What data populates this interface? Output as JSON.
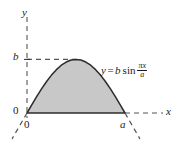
{
  "figure": {
    "colors": {
      "fill": "#c8c8c8",
      "stroke": "#2b2b2b",
      "dash": "#555555",
      "background": "#ffffff",
      "text": "#1a1a1a"
    },
    "axes": {
      "y_label": "y",
      "x_label": "x",
      "origin_y_label": "0",
      "origin_x_label": "0",
      "b_label": "b",
      "a_label": "a"
    },
    "equation": {
      "lhs": "y",
      "equals": "=",
      "amplitude": "b",
      "function": "sin",
      "numerator": "πx",
      "denominator": "a"
    }
  },
  "chart_data": {
    "type": "line",
    "title": "",
    "subtitle": "",
    "xlabel": "x",
    "ylabel": "y",
    "xlim": [
      0,
      1
    ],
    "ylim": [
      0,
      1
    ],
    "grid": false,
    "legend": null,
    "series": [
      {
        "name": "y = b sin(πx/a)",
        "equation": "y = b sin(πx/a)",
        "filled": true,
        "fill_color": "#c8c8c8",
        "x": [
          0.0,
          0.05,
          0.1,
          0.15,
          0.2,
          0.25,
          0.3,
          0.35,
          0.4,
          0.45,
          0.5,
          0.55,
          0.6,
          0.65,
          0.7,
          0.75,
          0.8,
          0.85,
          0.9,
          0.95,
          1.0
        ],
        "y": [
          0.0,
          0.156,
          0.309,
          0.454,
          0.588,
          0.707,
          0.809,
          0.891,
          0.951,
          0.988,
          1.0,
          0.988,
          0.951,
          0.891,
          0.809,
          0.707,
          0.588,
          0.454,
          0.309,
          0.156,
          0.0
        ]
      }
    ],
    "annotations": [
      {
        "text": "b",
        "x": 0.0,
        "y": 1.0,
        "role": "y-axis tick at amplitude"
      },
      {
        "text": "a",
        "x": 1.0,
        "y": 0.0,
        "role": "x-axis tick at period half"
      },
      {
        "text": "0",
        "x": 0.0,
        "y": 0.0,
        "role": "origin"
      },
      {
        "text": "y = b sin(πx/a)",
        "x": 0.72,
        "y": 0.62,
        "role": "curve equation label"
      }
    ],
    "guides": [
      {
        "type": "dashed-horizontal",
        "from": [
          0.0,
          1.0
        ],
        "to": [
          0.5,
          1.0
        ],
        "label": "b"
      },
      {
        "type": "dashed-axis",
        "orientation": "vertical",
        "label": "y"
      },
      {
        "type": "dashed-axis",
        "orientation": "horizontal",
        "label": "x"
      },
      {
        "type": "dashed-curve-extension",
        "side": "left",
        "note": "sine continues below axis for x<0"
      },
      {
        "type": "dashed-curve-extension",
        "side": "right",
        "note": "sine continues below axis for x>a"
      }
    ]
  }
}
